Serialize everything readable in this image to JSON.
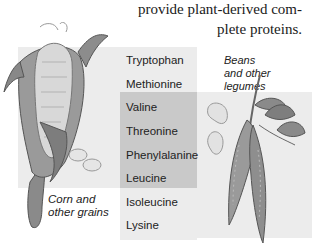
{
  "caption": {
    "line1": "provide plant-derived com-",
    "line2": "plete proteins."
  },
  "amino_acids": [
    {
      "name": "Tryptophan",
      "group": "grains"
    },
    {
      "name": "Methionine",
      "group": "grains"
    },
    {
      "name": "Valine",
      "group": "both"
    },
    {
      "name": "Threonine",
      "group": "both"
    },
    {
      "name": "Phenylalanine",
      "group": "both"
    },
    {
      "name": "Leucine",
      "group": "both"
    },
    {
      "name": "Isoleucine",
      "group": "legumes"
    },
    {
      "name": "Lysine",
      "group": "legumes"
    }
  ],
  "labels": {
    "corn_line1": "Corn and",
    "corn_line2": "other grains",
    "beans_line1": "Beans",
    "beans_line2": "and other",
    "beans_line3": "legumes"
  },
  "colors": {
    "panel_light": "#ececec",
    "panel_dark": "#c9c9c9",
    "text": "#222222"
  },
  "icons": [
    "corn-illustration",
    "corn-kernels",
    "bean-seeds",
    "pea-pods-plant"
  ]
}
